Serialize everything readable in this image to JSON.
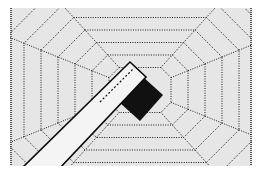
{
  "illustration": {
    "description": "Dotted concentric octagon tunnel with diagonal white bar and black block",
    "colors": {
      "background": "#ffffff",
      "panel": "#e6e6e6",
      "dots": "#1a1a1a",
      "bar_fill": "#f4f4f4",
      "bar_edge": "#0a0a0a",
      "block": "#111111"
    },
    "panel": {
      "x": 10,
      "y": 8,
      "width": 242,
      "height": 158
    },
    "center": {
      "x": 140,
      "y": 90
    },
    "octagon_count": 7
  }
}
